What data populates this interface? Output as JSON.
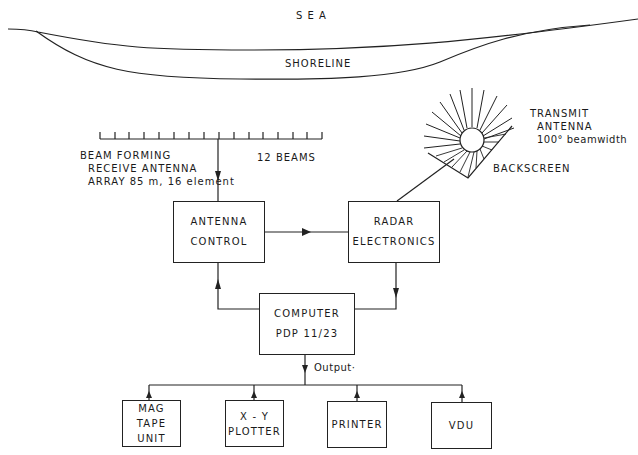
{
  "diagram": {
    "type": "block-diagram",
    "labels": {
      "sea": "S E A",
      "shoreline": "SHORELINE",
      "receive_antenna": [
        "BEAM FORMING",
        "RECEIVE  ANTENNA",
        "ARRAY 85 m, 16 element"
      ],
      "beams": "12 BEAMS",
      "transmit_antenna": [
        "TRANSMIT",
        "ANTENNA",
        "100° beamwidth"
      ],
      "backscreen": "BACKSCREEN",
      "output": "Output·"
    },
    "nodes": {
      "antenna_control": [
        "ANTENNA",
        "CONTROL"
      ],
      "radar_electronics": [
        "RADAR",
        "ELECTRONICS"
      ],
      "computer": [
        "COMPUTER",
        "PDP 11/23"
      ],
      "mag_tape": [
        "MAG",
        "TAPE",
        "UNIT"
      ],
      "xy_plotter": [
        "X - Y",
        "PLOTTER"
      ],
      "printer": [
        "PRINTER"
      ],
      "vdu": [
        "VDU"
      ]
    },
    "edges": [
      {
        "from": "receive_antenna_array",
        "to": "antenna_control"
      },
      {
        "from": "antenna_control",
        "to": "radar_electronics"
      },
      {
        "from": "radar_electronics",
        "to": "transmit_antenna"
      },
      {
        "from": "radar_electronics",
        "to": "computer"
      },
      {
        "from": "computer",
        "to": "antenna_control"
      },
      {
        "from": "computer",
        "to": "mag_tape",
        "label": "Output"
      },
      {
        "from": "computer",
        "to": "xy_plotter",
        "label": "Output"
      },
      {
        "from": "computer",
        "to": "printer",
        "label": "Output"
      },
      {
        "from": "computer",
        "to": "vdu",
        "label": "Output"
      }
    ],
    "array_elements": 16
  }
}
